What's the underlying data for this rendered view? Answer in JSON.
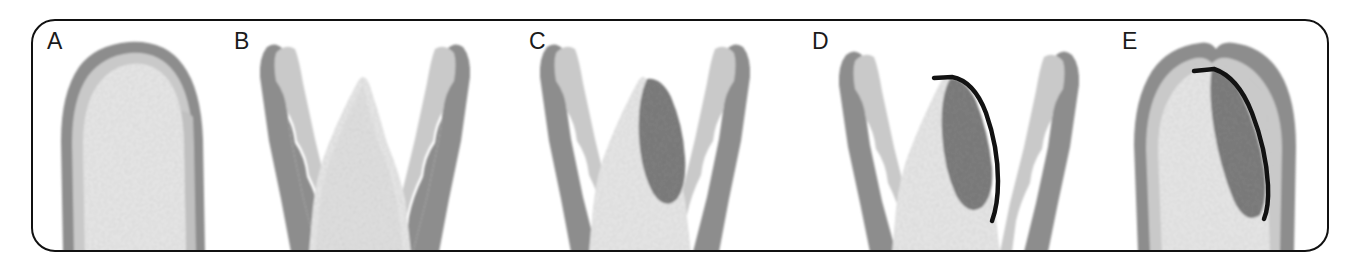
{
  "figure": {
    "kind": "scientific-illustration",
    "frame": {
      "shape": "rounded-rectangle",
      "border_color": "#111111",
      "background": "#ffffff"
    },
    "palette": {
      "outline_dark_gray": "#8d8d8d",
      "band_light_gray": "#c9c9c9",
      "core_stipple": "#ededed",
      "lesion_gray": "#878787",
      "membrane_black": "#121212",
      "label_black": "#1a1a1a",
      "page_white": "#ffffff"
    },
    "panels": [
      {
        "id": "a",
        "label": "A",
        "label_x": 14,
        "caption_semantics": "intact interdental bone covered by gingiva, dome-shaped crest"
      },
      {
        "id": "b",
        "label": "B",
        "label_x": 200,
        "caption_semantics": "bone crest exposed, gingival flaps reflected to either side"
      },
      {
        "id": "c",
        "label": "C",
        "label_x": 496,
        "caption_semantics": "bone defect filled with dark granulation lesion on one slope"
      },
      {
        "id": "d",
        "label": "D",
        "label_x": 779,
        "caption_semantics": "barrier membrane placed over the defect, flaps still reflected"
      },
      {
        "id": "e",
        "label": "E",
        "label_x": 1089,
        "caption_semantics": "flaps sutured closed over membrane and regenerating defect"
      }
    ]
  }
}
